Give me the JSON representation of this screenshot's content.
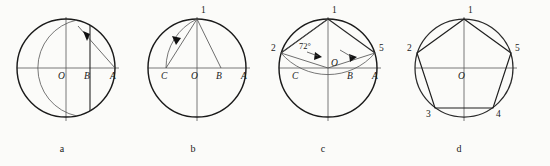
{
  "figure": {
    "panel_count": 4,
    "background_color": "#fbfbf9",
    "line_color": "#1a1a1a",
    "panels": [
      {
        "id": "a",
        "caption": "a",
        "caption_x": 62,
        "caption_y": 152,
        "center": {
          "x": 66,
          "y": 68,
          "label": "O"
        },
        "radius": 49,
        "axis": {
          "x1": 17,
          "x2": 119,
          "y": 68
        },
        "vaxis": {
          "x": 66,
          "y1": 17,
          "y2": 121
        },
        "points": [
          {
            "name": "O",
            "x": 66,
            "y": 68,
            "label": "O",
            "label_x": 58,
            "label_y": 79
          },
          {
            "name": "B",
            "x": 90,
            "y": 68,
            "label": "B",
            "label_x": 84,
            "label_y": 79
          },
          {
            "name": "A",
            "x": 115,
            "y": 68,
            "label": "A",
            "label_x": 110,
            "label_y": 79
          }
        ],
        "construction_note": "Arc centred at A with radius AO cuts circle; vertical chord through B bisects OA"
      },
      {
        "id": "b",
        "caption": "b",
        "caption_x": 193,
        "caption_y": 152,
        "center": {
          "x": 197,
          "y": 68,
          "label": "O"
        },
        "radius": 49,
        "axis": {
          "x1": 148,
          "x2": 250,
          "y": 68
        },
        "vaxis": {
          "x": 197,
          "y1": 17,
          "y2": 121
        },
        "points": [
          {
            "name": "C",
            "x": 166,
            "y": 68,
            "label": "C",
            "label_x": 161,
            "label_y": 79
          },
          {
            "name": "O",
            "x": 197,
            "y": 68,
            "label": "O",
            "label_x": 191,
            "label_y": 79
          },
          {
            "name": "B",
            "x": 221,
            "y": 68,
            "label": "B",
            "label_x": 216,
            "label_y": 79
          },
          {
            "name": "A",
            "x": 246,
            "y": 68,
            "label": "A",
            "label_x": 241,
            "label_y": 79
          },
          {
            "name": "1",
            "x": 197,
            "y": 19,
            "label": "1",
            "label_x": 201,
            "label_y": 13
          }
        ],
        "construction_note": "Arc centred at B with radius B1 swung down to the horizontal axis locating C"
      },
      {
        "id": "c",
        "caption": "c",
        "caption_x": 323,
        "caption_y": 152,
        "center": {
          "x": 328,
          "y": 68,
          "label": "O"
        },
        "radius": 49,
        "axis": {
          "x1": 279,
          "x2": 381,
          "y": 68
        },
        "vaxis": {
          "x": 328,
          "y1": 17,
          "y2": 121
        },
        "angle_label": "72°",
        "angle_label_x": 305,
        "angle_label_y": 49,
        "points": [
          {
            "name": "2",
            "x": 281,
            "y": 53,
            "label": "2",
            "label_x": 272,
            "label_y": 51
          },
          {
            "name": "5",
            "x": 375,
            "y": 53,
            "label": "5",
            "label_x": 379,
            "label_y": 51
          },
          {
            "name": "1",
            "x": 328,
            "y": 19,
            "label": "1",
            "label_x": 332,
            "label_y": 13
          },
          {
            "name": "C",
            "x": 297,
            "y": 68,
            "label": "C",
            "label_x": 292,
            "label_y": 79
          },
          {
            "name": "B",
            "x": 352,
            "y": 68,
            "label": "B",
            "label_x": 347,
            "label_y": 79
          },
          {
            "name": "A",
            "x": 377,
            "y": 68,
            "label": "A",
            "label_x": 372,
            "label_y": 79
          }
        ],
        "construction_note": "Chord C1 equals the pentagon side; stepping it round gives 72° central angles"
      },
      {
        "id": "d",
        "caption": "d",
        "caption_x": 459,
        "caption_y": 152,
        "center": {
          "x": 464,
          "y": 68,
          "label": "O"
        },
        "radius": 49,
        "axis": {
          "x1": 415,
          "x2": 517,
          "y": 68
        },
        "vaxis": {
          "x": 464,
          "y1": 17,
          "y2": 121
        },
        "points": [
          {
            "name": "1",
            "x": 464,
            "y": 19,
            "label": "1",
            "label_x": 468,
            "label_y": 13
          },
          {
            "name": "2",
            "x": 417,
            "y": 53,
            "label": "2",
            "label_x": 408,
            "label_y": 51
          },
          {
            "name": "3",
            "x": 435,
            "y": 108,
            "label": "3",
            "label_x": 427,
            "label_y": 116
          },
          {
            "name": "4",
            "x": 493,
            "y": 108,
            "label": "4",
            "label_x": 496,
            "label_y": 116
          },
          {
            "name": "5",
            "x": 511,
            "y": 53,
            "label": "5",
            "label_x": 515,
            "label_y": 51
          },
          {
            "name": "O",
            "x": 464,
            "y": 68,
            "label": "O",
            "label_x": 458,
            "label_y": 79
          }
        ],
        "construction_note": "Completed regular pentagon 1-2-3-4-5 inscribed in the circle"
      }
    ]
  }
}
